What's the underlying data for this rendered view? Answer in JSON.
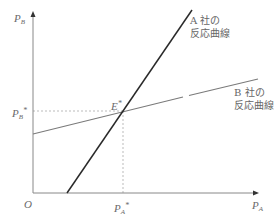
{
  "diagram": {
    "type": "reaction-curves",
    "axes": {
      "y_label_main": "P",
      "y_label_sub": "B",
      "x_label_main": "P",
      "x_label_sub": "A",
      "origin_label": "O"
    },
    "equilibrium": {
      "point_label_main": "E",
      "point_label_sup": "*",
      "pb_star_main": "P",
      "pb_star_sub": "B",
      "pb_star_sup": "*",
      "pa_star_main": "P",
      "pa_star_sub": "A",
      "pa_star_sup": "*"
    },
    "curves": [
      {
        "id": "A",
        "label_line1": "A 社の",
        "label_line2": "反応曲線",
        "color": "#2a2a2a"
      },
      {
        "id": "B",
        "label_line1": "B 社の",
        "label_line2": "反応曲線",
        "color": "#7a7a7a"
      }
    ],
    "colors": {
      "axis": "#888888",
      "dashed": "#aaaaaa"
    }
  }
}
